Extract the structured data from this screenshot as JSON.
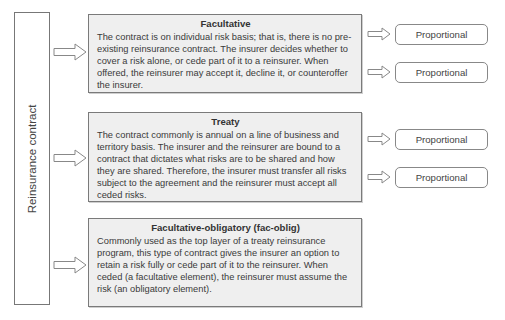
{
  "root": {
    "label": "Reinsurance contract",
    "icon": "block-arrow-right-icon"
  },
  "categories": [
    {
      "title": "Facultative",
      "body": "The contract is on individual risk basis; that is, there is no pre-existing reinsurance contract. The insurer decides whether to cover a risk alone, or cede part of it to a reinsurer. When offered, the reinsurer may accept it, decline it, or counteroffer the insurer.",
      "outcomes": [
        "Proportional",
        "Proportional"
      ]
    },
    {
      "title": "Treaty",
      "body": "The contract commonly is annual on a line of business and territory basis. The insurer and the reinsurer are bound to a contract that dictates what risks are to be shared and how they are shared. Therefore, the insurer must transfer all risks subject to the agreement and the reinsurer must accept all ceded risks.",
      "outcomes": [
        "Proportional",
        "Proportional"
      ]
    },
    {
      "title": "Facultative-obligatory (fac-oblig)",
      "body": "Commonly used as the top layer of a treaty reinsurance program, this type of contract gives the insurer an option to retain a risk fully or cede part of it to the reinsurer. When ceded (a facultative element), the reinsurer must assume the risk (an obligatory element).",
      "outcomes": []
    }
  ],
  "colors": {
    "card_fill": "#efefef",
    "card_border": "#7a7a7a",
    "outline": "#888888",
    "text": "#333333"
  }
}
